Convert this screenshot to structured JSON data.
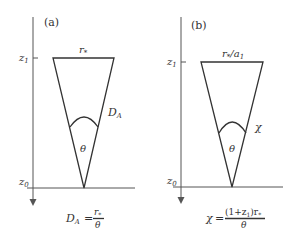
{
  "panels": [
    {
      "label": "(a)",
      "top_label_main": "r",
      "top_label_sub": "*",
      "top_label_suffix": "",
      "top_label_suffix_sub": "",
      "side_label_main": "D",
      "side_label_sub": "A",
      "angle_label": "θ",
      "z_top_main": "z",
      "z_top_sub": "1",
      "z_bottom_main": "z",
      "z_bottom_sub": "0",
      "formula": {
        "lhs_main": "D",
        "lhs_sub": "A",
        "equals": "=",
        "numerator": "r",
        "numerator_sub": "*",
        "denominator": "θ"
      }
    },
    {
      "label": "(b)",
      "top_label_main": "r",
      "top_label_sub": "*",
      "top_label_suffix": "/a",
      "top_label_suffix_sub": "1",
      "side_label_main": "χ",
      "side_label_sub": "",
      "angle_label": "θ",
      "z_top_main": "z",
      "z_top_sub": "1",
      "z_bottom_main": "z",
      "z_bottom_sub": "0",
      "formula": {
        "lhs_main": "χ",
        "lhs_sub": "",
        "equals": "=",
        "numerator_pre": "(1+z",
        "numerator_pre_sub": "1",
        "numerator_post": ")r",
        "numerator_post_sub": "*",
        "denominator": "θ"
      }
    }
  ]
}
